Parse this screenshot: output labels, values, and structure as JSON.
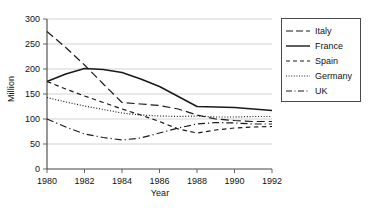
{
  "chart_data": {
    "type": "line",
    "title": "",
    "xlabel": "Year",
    "ylabel": "Million",
    "xlim": [
      1980,
      1992
    ],
    "ylim": [
      0,
      300
    ],
    "grid": true,
    "legend_position": "right",
    "x": [
      1980,
      1981,
      1982,
      1983,
      1984,
      1985,
      1986,
      1987,
      1988,
      1989,
      1990,
      1991,
      1992
    ],
    "xticks": [
      "1980",
      "1982",
      "1984",
      "1986",
      "1988",
      "1990",
      "1992"
    ],
    "yticks": [
      "0",
      "50",
      "100",
      "150",
      "200",
      "250",
      "300"
    ],
    "series": [
      {
        "name": "Italy",
        "style": "long-dash",
        "color": "#1a1a1a",
        "values": [
          275,
          243,
          208,
          170,
          133,
          130,
          127,
          120,
          108,
          100,
          97,
          95,
          95
        ]
      },
      {
        "name": "France",
        "style": "solid",
        "color": "#1a1a1a",
        "values": [
          175,
          190,
          201,
          199,
          193,
          180,
          165,
          145,
          125,
          124,
          123,
          120,
          117
        ]
      },
      {
        "name": "Spain",
        "style": "short-dash",
        "color": "#1a1a1a",
        "values": [
          175,
          160,
          146,
          133,
          120,
          108,
          95,
          80,
          72,
          78,
          82,
          84,
          85
        ]
      },
      {
        "name": "Germany",
        "style": "dotted",
        "color": "#1a1a1a",
        "values": [
          143,
          134,
          126,
          119,
          112,
          108,
          106,
          105,
          106,
          104,
          104,
          105,
          105
        ]
      },
      {
        "name": "UK",
        "style": "dash-dot",
        "color": "#1a1a1a",
        "values": [
          100,
          84,
          70,
          63,
          58,
          62,
          72,
          82,
          90,
          93,
          92,
          90,
          90
        ]
      }
    ]
  },
  "legend": {
    "items": [
      {
        "label": "Italy"
      },
      {
        "label": "France"
      },
      {
        "label": "Spain"
      },
      {
        "label": "Germany"
      },
      {
        "label": "UK"
      }
    ]
  }
}
